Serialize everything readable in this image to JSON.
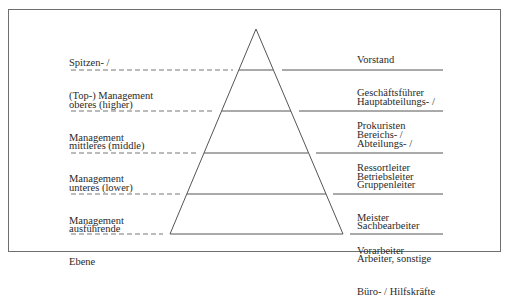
{
  "levels": [
    {
      "left_lines": [
        "Spitzen- /",
        "(Top-) Management"
      ],
      "right_lines": [
        "Vorstand",
        "Geschäftsführer",
        "Prokuristen"
      ]
    },
    {
      "left_lines": [
        "oberes (higher)",
        "Management"
      ],
      "right_lines": [
        "Hauptabteilungs- /",
        "Bereichs- /",
        "Ressortleiter"
      ]
    },
    {
      "left_lines": [
        "mittleres (middle)",
        "Management"
      ],
      "right_lines": [
        "Abteilungs- /",
        "Betriebsleiter"
      ]
    },
    {
      "left_lines": [
        "unteres (lower)",
        "Management"
      ],
      "right_lines": [
        "Gruppenleiter",
        "Meister",
        "Vorarbeiter"
      ]
    },
    {
      "left_lines": [
        "ausführende",
        "Ebene"
      ],
      "right_lines": [
        "Sachbearbeiter",
        "Arbeiter, sonstige",
        "Büro- / Hilfskräfte"
      ]
    }
  ],
  "colors": {
    "line": "#555555",
    "dash": "#777777",
    "frame": "#6f6f6f",
    "text": "#2a2a2a"
  }
}
